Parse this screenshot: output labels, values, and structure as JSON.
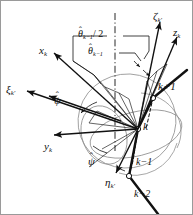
{
  "figure": {
    "type": "technical-vector-diagram",
    "background_color": "#ffffff",
    "border_color": "#9a9a9a",
    "stroke_color": "#111111",
    "light_stroke_color": "#8a8a8a",
    "hub": {
      "x": 137,
      "y": 128
    }
  },
  "labels": {
    "zeta_k_prime": {
      "base": "ζ",
      "sub": "k′",
      "x": 152,
      "y": 10
    },
    "z_k": {
      "base": "z",
      "sub": "k",
      "x": 172,
      "y": 26
    },
    "x_k": {
      "base": "x",
      "sub": "k",
      "x": 38,
      "y": 44
    },
    "xi_k_prime": {
      "base": "ξ",
      "sub": "k′",
      "x": 5,
      "y": 83
    },
    "y_k": {
      "base": "y",
      "sub": "k",
      "x": 43,
      "y": 140
    },
    "eta_k_prime": {
      "base": "η",
      "sub": "k′",
      "x": 104,
      "y": 176
    },
    "theta_half": {
      "base": "θ",
      "sub": "k−1",
      "suffix": "/ 2",
      "hat": "ˆ",
      "x": 77,
      "y": 28
    },
    "theta_full": {
      "base": "θ",
      "sub": "k−1",
      "suffix": "",
      "hat": "ˆ",
      "x": 87,
      "y": 45
    },
    "psi_upper": {
      "base": "ψ",
      "hat": "ˆ",
      "x": 53,
      "y": 94
    },
    "psi_lower": {
      "base": "ψ",
      "hat": "ˆ",
      "x": 87,
      "y": 155
    },
    "node_k_plus_1": {
      "text": "k+1",
      "x": 157,
      "y": 80
    },
    "node_k": {
      "text": "k",
      "x": 142,
      "y": 120
    },
    "node_k_minus_1": {
      "text": "k−1",
      "x": 135,
      "y": 156
    },
    "node_k_minus_2": {
      "text": "k−2",
      "x": 133,
      "y": 188
    }
  },
  "vectors": [
    {
      "name": "zeta-k-prime-axis",
      "x1": 137,
      "y1": 128,
      "x2": 159,
      "y2": 21
    },
    {
      "name": "z-k-axis",
      "x1": 137,
      "y1": 128,
      "x2": 176,
      "y2": 36
    },
    {
      "name": "x-k-axis",
      "x1": 137,
      "y1": 128,
      "x2": 53,
      "y2": 52
    },
    {
      "name": "xi-k-prime-axis",
      "x1": 137,
      "y1": 128,
      "x2": 26,
      "y2": 90
    },
    {
      "name": "y-k-axis",
      "x1": 137,
      "y1": 128,
      "x2": 53,
      "y2": 134
    },
    {
      "name": "eta-k-prime-axis",
      "x1": 137,
      "y1": 128,
      "x2": 115,
      "y2": 172
    }
  ],
  "chain_nodes": [
    {
      "name": "node-k-plus-1-joint",
      "x": 152,
      "y": 97
    },
    {
      "name": "node-k-joint",
      "x": 137,
      "y": 128
    },
    {
      "name": "node-k-minus-2-joint",
      "x": 128,
      "y": 175
    }
  ],
  "axis_line": {
    "name": "dash-dot-vertical-axis",
    "x": 114,
    "y1": 12,
    "y2": 150
  }
}
